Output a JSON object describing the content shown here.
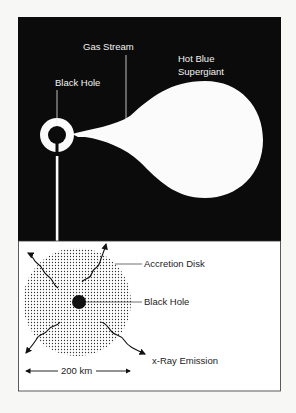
{
  "figure": {
    "top_panel": {
      "background": "#0b0b0b",
      "labels": {
        "gas_stream": "Gas Stream",
        "supergiant_line1": "Hot Blue",
        "supergiant_line2": "Supergiant",
        "black_hole": "Black Hole"
      }
    },
    "bottom_panel": {
      "background": "#ffffff",
      "labels": {
        "accretion_disk": "Accretion Disk",
        "black_hole": "Black Hole",
        "xray_emission": "x-Ray  Emission",
        "scale": "200 km"
      }
    }
  }
}
